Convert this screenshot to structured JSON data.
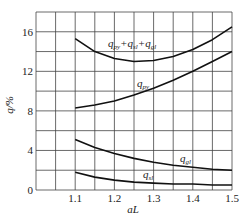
{
  "chart_data": {
    "type": "line",
    "title": "",
    "xlabel": "aL",
    "ylabel": "q/%",
    "xlim": [
      1.0,
      1.5
    ],
    "ylim": [
      0,
      18
    ],
    "grid": true,
    "xticks": [
      "1.1",
      "1.2",
      "1.3",
      "1.4",
      "1.5"
    ],
    "yticks": [
      "0",
      "4",
      "8",
      "12",
      "16"
    ],
    "x": [
      1.1,
      1.15,
      1.2,
      1.25,
      1.3,
      1.35,
      1.4,
      1.45,
      1.5
    ],
    "series": [
      {
        "name": "q_py+q_sl+q_gl",
        "label": "qpy+qsl+qgl",
        "values": [
          15.3,
          14.0,
          13.3,
          13.0,
          13.1,
          13.5,
          14.2,
          15.2,
          16.5
        ]
      },
      {
        "name": "q_py",
        "label": "qpy",
        "values": [
          8.3,
          8.6,
          9.0,
          9.6,
          10.3,
          11.1,
          12.0,
          13.0,
          14.0
        ]
      },
      {
        "name": "q_gl",
        "label": "qgl",
        "values": [
          5.1,
          4.3,
          3.7,
          3.2,
          2.8,
          2.5,
          2.3,
          2.1,
          2.0
        ]
      },
      {
        "name": "q_sl",
        "label": "qsl",
        "values": [
          1.8,
          1.3,
          1.0,
          0.8,
          0.7,
          0.6,
          0.6,
          0.5,
          0.5
        ]
      }
    ]
  }
}
